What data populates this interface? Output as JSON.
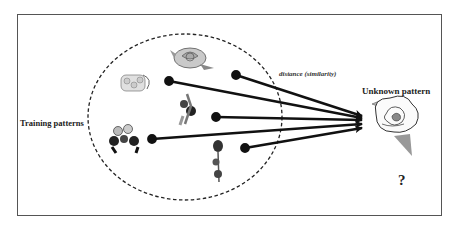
{
  "labels": {
    "training": "Training patterns",
    "unknown": "Unknown pattern",
    "distance": "distance (similarity)",
    "question": "?"
  },
  "colors": {
    "frame": "#555555",
    "arrow": "#111111",
    "ellipse": "#222222"
  },
  "training_set": {
    "ellipse": {
      "cx": 185,
      "cy": 117,
      "rx": 97,
      "ry": 83
    },
    "patterns": [
      {
        "name": "pink-rose",
        "x": 170,
        "y": 45
      },
      {
        "name": "white-flower-bunch",
        "x": 118,
        "y": 70
      },
      {
        "name": "dark-flower-sprig",
        "x": 178,
        "y": 95
      },
      {
        "name": "dark-bouquet",
        "x": 105,
        "y": 125
      },
      {
        "name": "red-rose-stem",
        "x": 212,
        "y": 142
      }
    ]
  },
  "arrows": [
    {
      "from": [
        236,
        75
      ],
      "to": [
        362,
        116
      ]
    },
    {
      "from": [
        169,
        81
      ],
      "to": [
        362,
        118
      ]
    },
    {
      "from": [
        216,
        117
      ],
      "to": [
        362,
        120
      ]
    },
    {
      "from": [
        152,
        139
      ],
      "to": [
        362,
        124
      ]
    },
    {
      "from": [
        245,
        148
      ],
      "to": [
        362,
        128
      ]
    }
  ],
  "unknown": {
    "name": "rose-outline",
    "x": 372,
    "y": 98
  }
}
